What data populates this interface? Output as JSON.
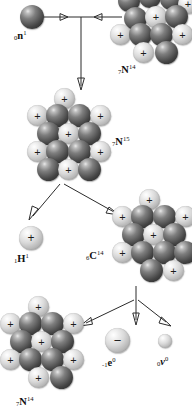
{
  "diagram": {
    "colors": {
      "proton_light": "#d9d9d9",
      "neutron_dark": "#454545",
      "arrow": "#2b2b2b",
      "background": "#ffffff",
      "text": "#111111"
    },
    "glyphs": {
      "proton_sign": "+",
      "electron_sign": "−",
      "neutrino_sign": ""
    },
    "particles": [
      {
        "id": "neutron-reactant",
        "name": "neutron",
        "sub": "0",
        "symbol": "n",
        "sup": "1",
        "label_x": 14,
        "label_y": 30,
        "type": "neutron"
      },
      {
        "id": "nitrogen-14-reactant",
        "name": "nitrogen-14",
        "sub": "7",
        "symbol": "N",
        "sup": "14",
        "label_x": 118,
        "label_y": 64,
        "type": "nucleus"
      },
      {
        "id": "nitrogen-15-intermediate",
        "name": "nitrogen-15",
        "sub": "7",
        "symbol": "N",
        "sup": "15",
        "label_x": 112,
        "label_y": 136,
        "type": "nucleus"
      },
      {
        "id": "hydrogen-1-product",
        "name": "hydrogen-1 proton",
        "sub": "1",
        "symbol": "H",
        "sup": "1",
        "label_x": 14,
        "label_y": 253,
        "type": "proton"
      },
      {
        "id": "carbon-14-product",
        "name": "carbon-14",
        "sub": "6",
        "symbol": "C",
        "sup": "14",
        "label_x": 86,
        "label_y": 250,
        "type": "nucleus"
      },
      {
        "id": "nitrogen-14-product",
        "name": "nitrogen-14",
        "sub": "7",
        "symbol": "N",
        "sup": "14",
        "label_x": 16,
        "label_y": 396,
        "type": "nucleus"
      },
      {
        "id": "electron-product",
        "name": "beta electron",
        "sub": "-1",
        "symbol": "e",
        "sup": "0",
        "label_x": 102,
        "label_y": 357,
        "type": "electron"
      },
      {
        "id": "neutrino-product",
        "name": "neutrino",
        "sub": "0",
        "symbol": "ν",
        "sup": "0",
        "label_x": 157,
        "label_y": 356,
        "type": "neutrino"
      }
    ]
  }
}
